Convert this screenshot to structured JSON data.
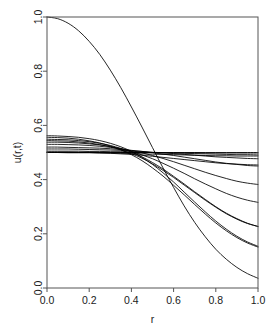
{
  "chart_data": {
    "type": "line",
    "title": "",
    "subtitle": "",
    "xlabel": "r",
    "ylabel": "u(r,t)",
    "xlim": [
      0.0,
      1.0
    ],
    "ylim": [
      0.0,
      1.0
    ],
    "xticks": [
      "0.0",
      "0.2",
      "0.4",
      "0.6",
      "0.8",
      "1.0"
    ],
    "xtick_values": [
      0.0,
      0.2,
      0.4,
      0.6,
      0.8,
      1.0
    ],
    "yticks": [
      "0.0",
      "0.2",
      "0.4",
      "0.6",
      "0.8",
      "1.0"
    ],
    "ytick_values": [
      0.0,
      0.2,
      0.4,
      0.6,
      0.8,
      1.0
    ],
    "grid": false,
    "legend": null,
    "legend_position": "none",
    "box": true,
    "line_color": "#000000",
    "background_color": "#ffffff",
    "axis_color": "#000000",
    "crossing_point": {
      "r": 0.36,
      "u": 0.49
    },
    "steady_state": 0.5,
    "x": [
      0.0,
      0.05,
      0.1,
      0.15,
      0.2,
      0.25,
      0.3,
      0.35,
      0.4,
      0.45,
      0.5,
      0.55,
      0.6,
      0.65,
      0.7,
      0.75,
      0.8,
      0.85,
      0.9,
      0.95,
      1.0
    ],
    "series": [
      {
        "name": "t0",
        "values": [
          1.0,
          0.994,
          0.977,
          0.949,
          0.91,
          0.862,
          0.804,
          0.739,
          0.668,
          0.594,
          0.518,
          0.443,
          0.371,
          0.303,
          0.242,
          0.189,
          0.143,
          0.106,
          0.076,
          0.053,
          0.036
        ]
      },
      {
        "name": "t1",
        "values": [
          0.562,
          0.561,
          0.559,
          0.556,
          0.551,
          0.544,
          0.534,
          0.521,
          0.504,
          0.482,
          0.456,
          0.425,
          0.391,
          0.354,
          0.317,
          0.281,
          0.247,
          0.217,
          0.191,
          0.17,
          0.154
        ]
      },
      {
        "name": "t2",
        "values": [
          0.549,
          0.548,
          0.547,
          0.544,
          0.54,
          0.534,
          0.526,
          0.515,
          0.501,
          0.484,
          0.463,
          0.439,
          0.412,
          0.384,
          0.355,
          0.327,
          0.3,
          0.276,
          0.256,
          0.239,
          0.227
        ]
      },
      {
        "name": "t3",
        "values": [
          0.538,
          0.538,
          0.537,
          0.535,
          0.532,
          0.528,
          0.522,
          0.514,
          0.504,
          0.491,
          0.477,
          0.46,
          0.442,
          0.423,
          0.403,
          0.384,
          0.366,
          0.349,
          0.335,
          0.324,
          0.316
        ]
      },
      {
        "name": "t4",
        "values": [
          0.53,
          0.53,
          0.529,
          0.528,
          0.526,
          0.523,
          0.519,
          0.514,
          0.507,
          0.499,
          0.489,
          0.478,
          0.466,
          0.453,
          0.44,
          0.427,
          0.415,
          0.404,
          0.394,
          0.387,
          0.382
        ]
      },
      {
        "name": "t5",
        "values": [
          0.52,
          0.52,
          0.519,
          0.518,
          0.517,
          0.516,
          0.514,
          0.511,
          0.508,
          0.504,
          0.499,
          0.494,
          0.489,
          0.483,
          0.477,
          0.471,
          0.465,
          0.46,
          0.456,
          0.452,
          0.45
        ]
      },
      {
        "name": "t6",
        "values": [
          0.513,
          0.513,
          0.513,
          0.512,
          0.511,
          0.51,
          0.509,
          0.508,
          0.506,
          0.504,
          0.501,
          0.499,
          0.496,
          0.493,
          0.49,
          0.487,
          0.484,
          0.482,
          0.48,
          0.478,
          0.477
        ]
      },
      {
        "name": "t7",
        "values": [
          0.505,
          0.505,
          0.505,
          0.505,
          0.504,
          0.504,
          0.503,
          0.503,
          0.502,
          0.501,
          0.5,
          0.499,
          0.498,
          0.497,
          0.496,
          0.495,
          0.494,
          0.493,
          0.492,
          0.492,
          0.491
        ]
      },
      {
        "name": "t8",
        "values": [
          0.501,
          0.501,
          0.501,
          0.501,
          0.501,
          0.5,
          0.5,
          0.5,
          0.5,
          0.5,
          0.5,
          0.499,
          0.499,
          0.499,
          0.499,
          0.498,
          0.498,
          0.498,
          0.498,
          0.498,
          0.498
        ]
      },
      {
        "name": "t9",
        "values": [
          0.5,
          0.5,
          0.5,
          0.5,
          0.5,
          0.5,
          0.5,
          0.5,
          0.5,
          0.5,
          0.5,
          0.5,
          0.5,
          0.5,
          0.5,
          0.5,
          0.5,
          0.5,
          0.5,
          0.5,
          0.5
        ]
      },
      {
        "name": "t10",
        "values": [
          0.5,
          0.5,
          0.499,
          0.499,
          0.499,
          0.498,
          0.498,
          0.497,
          0.496,
          0.495,
          0.494,
          0.493,
          0.492,
          0.491,
          0.49,
          0.489,
          0.488,
          0.488,
          0.487,
          0.487,
          0.487
        ]
      },
      {
        "name": "t11",
        "values": [
          0.501,
          0.501,
          0.501,
          0.5,
          0.5,
          0.499,
          0.497,
          0.495,
          0.493,
          0.49,
          0.486,
          0.482,
          0.478,
          0.474,
          0.47,
          0.466,
          0.462,
          0.459,
          0.457,
          0.455,
          0.454
        ]
      },
      {
        "name": "t12",
        "values": [
          0.556,
          0.555,
          0.553,
          0.549,
          0.543,
          0.535,
          0.524,
          0.51,
          0.492,
          0.47,
          0.443,
          0.413,
          0.379,
          0.344,
          0.308,
          0.273,
          0.24,
          0.211,
          0.186,
          0.166,
          0.151
        ]
      },
      {
        "name": "t13",
        "values": [
          0.544,
          0.543,
          0.542,
          0.539,
          0.535,
          0.529,
          0.521,
          0.51,
          0.496,
          0.479,
          0.458,
          0.434,
          0.408,
          0.38,
          0.352,
          0.324,
          0.298,
          0.274,
          0.254,
          0.238,
          0.227
        ]
      }
    ]
  },
  "plot_geometry": {
    "box_left": 47,
    "box_top": 17,
    "box_right": 258,
    "box_bottom": 288
  }
}
